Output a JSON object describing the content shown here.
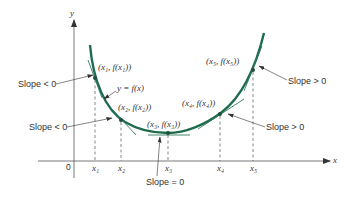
{
  "figure": {
    "axes": {
      "x_label": "x",
      "y_label": "y",
      "origin_label": "0"
    },
    "curve_label": "y = f(x)",
    "curve_color": "#1f6b4e",
    "points": [
      {
        "x_label": "x₁",
        "point_label": "(x₁, f(x₁))"
      },
      {
        "x_label": "x₂",
        "point_label": "(x₂, f(x₂))"
      },
      {
        "x_label": "x₃",
        "point_label": "(x₃, f(x₃))"
      },
      {
        "x_label": "x₄",
        "point_label": "(x₄, f(x₄))"
      },
      {
        "x_label": "x₅",
        "point_label": "(x₅, f(x₅))"
      }
    ],
    "slope_annotations": [
      {
        "label": "Slope < 0",
        "target": "x1"
      },
      {
        "label": "Slope < 0",
        "target": "x2"
      },
      {
        "label": "Slope = 0",
        "target": "x3"
      },
      {
        "label": "Slope > 0",
        "target": "x4"
      },
      {
        "label": "Slope > 0",
        "target": "x5"
      }
    ]
  }
}
